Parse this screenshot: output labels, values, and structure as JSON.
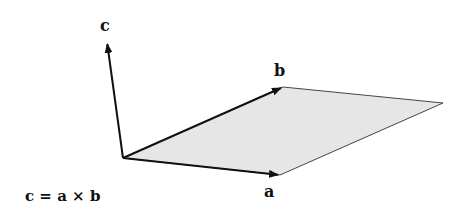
{
  "diagram": {
    "labels": {
      "c": "c",
      "b": "b",
      "a": "a",
      "formula": "c = a × b"
    },
    "colors": {
      "background": "#ffffff",
      "stroke": "#111111",
      "fill": "#e6e6e6",
      "edge": "#333333"
    },
    "points": {
      "origin": [
        123,
        158
      ],
      "a_tip": [
        280,
        175
      ],
      "b_tip": [
        283,
        87
      ],
      "far_corner": [
        443,
        103
      ],
      "c_tip": [
        107,
        42
      ]
    },
    "vectors": [
      {
        "name": "a",
        "from": "origin",
        "to": "a_tip"
      },
      {
        "name": "b",
        "from": "origin",
        "to": "b_tip"
      },
      {
        "name": "c",
        "from": "origin",
        "to": "c_tip"
      }
    ]
  }
}
